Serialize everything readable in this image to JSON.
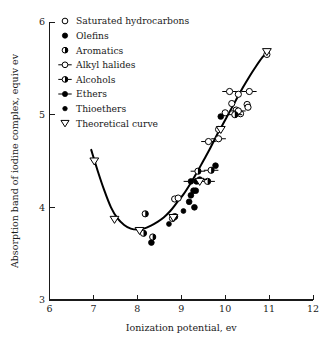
{
  "chart_data": {
    "type": "scatter",
    "title": "",
    "xlabel": "Ionization potential, ev",
    "ylabel": "Absorption band of iodine complex, equiv ev",
    "xlim": [
      6,
      12
    ],
    "ylim": [
      3,
      6
    ],
    "xticks": [
      "6",
      "7",
      "8",
      "9",
      "10",
      "11",
      "12"
    ],
    "yticks": [
      "3",
      "4",
      "5",
      "6"
    ],
    "grid": false,
    "legend_position": "top-left-inside",
    "legend": [
      {
        "label": "Saturated hydrocarbons",
        "marker": "open-circle"
      },
      {
        "label": "Olefins",
        "marker": "filled-circle"
      },
      {
        "label": "Aromatics",
        "marker": "half-filled-circle"
      },
      {
        "label": "Alkyl halides",
        "marker": "open-circle-with-horizontal-bar"
      },
      {
        "label": "Alcohols",
        "marker": "half-filled-circle-with-horizontal-bar"
      },
      {
        "label": "Ethers",
        "marker": "filled-circle-with-horizontal-bar"
      },
      {
        "label": "Thioethers",
        "marker": "filled-circle-small"
      },
      {
        "label": "Theoretical curve",
        "marker": "open-down-triangle"
      }
    ],
    "series": [
      {
        "name": "Saturated hydrocarbons",
        "marker": "open-circle",
        "points": [
          [
            8.85,
            4.09
          ],
          [
            8.93,
            4.1
          ],
          [
            9.85,
            4.84
          ],
          [
            10.0,
            5.02
          ],
          [
            10.15,
            5.12
          ],
          [
            10.25,
            5.05
          ],
          [
            10.3,
            5.22
          ],
          [
            10.35,
            5.01
          ],
          [
            10.5,
            5.11
          ],
          [
            10.52,
            5.08
          ],
          [
            10.95,
            5.65
          ]
        ]
      },
      {
        "name": "Olefins",
        "marker": "filled-circle",
        "points": [
          [
            8.32,
            3.62
          ],
          [
            9.18,
            4.06
          ],
          [
            9.22,
            4.13
          ],
          [
            9.28,
            4.18
          ],
          [
            9.3,
            4.0
          ],
          [
            9.33,
            4.18
          ],
          [
            9.35,
            4.28
          ],
          [
            9.78,
            4.45
          ],
          [
            9.9,
            4.98
          ]
        ]
      },
      {
        "name": "Aromatics",
        "marker": "half-filled-circle",
        "points": [
          [
            8.18,
            3.93
          ],
          [
            8.35,
            3.68
          ],
          [
            8.8,
            3.88
          ],
          [
            8.85,
            3.9
          ],
          [
            8.14,
            3.72
          ]
        ]
      },
      {
        "name": "Alkyl halides",
        "marker": "open-circle-with-horizontal-bar",
        "points": [
          [
            9.62,
            4.71
          ],
          [
            9.85,
            4.74
          ],
          [
            10.1,
            5.25
          ],
          [
            10.55,
            5.25
          ],
          [
            10.3,
            5.04
          ]
        ]
      },
      {
        "name": "Alcohols",
        "marker": "half-filled-circle-with-horizontal-bar",
        "points": [
          [
            9.38,
            4.39
          ],
          [
            9.6,
            4.28
          ],
          [
            9.68,
            4.4
          ],
          [
            10.22,
            5.0
          ]
        ]
      },
      {
        "name": "Ethers",
        "marker": "filled-circle-with-horizontal-bar",
        "points": [
          [
            9.22,
            4.28
          ],
          [
            9.42,
            4.3
          ]
        ]
      },
      {
        "name": "Thioethers",
        "marker": "filled-circle-small",
        "points": [
          [
            8.72,
            3.82
          ],
          [
            9.05,
            3.96
          ]
        ]
      },
      {
        "name": "Theoretical curve",
        "marker": "open-down-triangle",
        "points": [
          [
            7.02,
            4.5
          ],
          [
            7.48,
            3.87
          ],
          [
            8.05,
            3.75
          ],
          [
            8.82,
            3.89
          ],
          [
            9.42,
            4.28
          ],
          [
            9.9,
            4.84
          ],
          [
            10.95,
            5.68
          ]
        ]
      }
    ],
    "theoretical_curve": [
      [
        6.95,
        4.62
      ],
      [
        7.1,
        4.39
      ],
      [
        7.25,
        4.18
      ],
      [
        7.4,
        4.0
      ],
      [
        7.55,
        3.88
      ],
      [
        7.7,
        3.81
      ],
      [
        7.85,
        3.77
      ],
      [
        8.0,
        3.76
      ],
      [
        8.15,
        3.77
      ],
      [
        8.3,
        3.8
      ],
      [
        8.45,
        3.84
      ],
      [
        8.6,
        3.89
      ],
      [
        8.75,
        3.96
      ],
      [
        8.9,
        4.05
      ],
      [
        9.05,
        4.14
      ],
      [
        9.2,
        4.25
      ],
      [
        9.35,
        4.37
      ],
      [
        9.5,
        4.5
      ],
      [
        9.65,
        4.63
      ],
      [
        9.8,
        4.77
      ],
      [
        9.95,
        4.9
      ],
      [
        10.1,
        5.03
      ],
      [
        10.25,
        5.16
      ],
      [
        10.4,
        5.29
      ],
      [
        10.55,
        5.41
      ],
      [
        10.7,
        5.52
      ],
      [
        10.85,
        5.62
      ],
      [
        11.0,
        5.7
      ]
    ]
  }
}
